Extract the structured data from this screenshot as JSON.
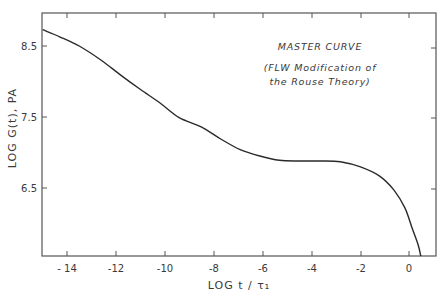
{
  "chart_data": {
    "type": "line",
    "title": "",
    "xlabel": "LOG t/τ₁",
    "ylabel": "LOG G(t), PA",
    "xlim": [
      -15.0,
      1.1
    ],
    "ylim": [
      5.55,
      9.0
    ],
    "grid": false,
    "x_ticks": [
      -14,
      -12,
      -10,
      -8,
      -6,
      -4,
      -2,
      0
    ],
    "x_tick_labels": [
      "-14",
      "-12",
      "-10",
      "-8",
      "-6",
      "-4",
      "-2",
      "0"
    ],
    "y_ticks": [
      6.5,
      7.5,
      8.5
    ],
    "y_tick_labels": [
      "6.5",
      "7.5",
      "8.5"
    ],
    "annotations": [
      "MASTER CURVE",
      "(FLW Modification of",
      "the Rouse Theory)"
    ],
    "series": [
      {
        "name": "Master curve",
        "x": [
          -15.0,
          -14.3,
          -13.5,
          -12.6,
          -11.8,
          -11.0,
          -10.2,
          -9.4,
          -8.5,
          -7.7,
          -6.9,
          -6.1,
          -5.3,
          -4.5,
          -3.6,
          -2.8,
          -2.0,
          -1.2,
          -0.6,
          -0.15,
          0.14,
          0.39,
          0.5
        ],
        "y": [
          8.73,
          8.63,
          8.5,
          8.3,
          8.09,
          7.89,
          7.7,
          7.49,
          7.36,
          7.19,
          7.04,
          6.95,
          6.89,
          6.88,
          6.88,
          6.87,
          6.8,
          6.67,
          6.47,
          6.22,
          5.94,
          5.7,
          5.54
        ]
      }
    ]
  },
  "plot": {
    "annotation_title": "MASTER CURVE",
    "annotation_line1": "(FLW Modification of",
    "annotation_line2": "the Rouse Theory)",
    "x_axis_label": "LOG  t / τ₁",
    "y_axis_label": "LOG  G(t),  PA",
    "x_tick_labels": [
      "- 14",
      "-12",
      "-10",
      "-8",
      "-6",
      "-4",
      "-2",
      "0"
    ],
    "y_tick_labels": [
      "8.5",
      "7.5",
      "6.5"
    ],
    "line_color": "#2a2a2a",
    "axis_color": "#555555"
  }
}
